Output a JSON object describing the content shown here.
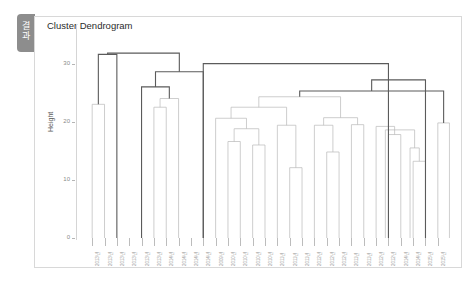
{
  "window": {
    "tab_label_line1": "결",
    "tab_label_line2": "과"
  },
  "chart_data": {
    "type": "dendrogram",
    "title": "Cluster Dendrogram",
    "xlabel": "",
    "ylabel": "Height",
    "ylim": [
      0,
      32
    ],
    "yticks": [
      0,
      10,
      20,
      30
    ],
    "ytick_labels": [
      "0",
      "10",
      "20",
      "30"
    ],
    "grid": false,
    "legend": "none",
    "leaf_count": 29,
    "leaf_labels": [
      "2013년",
      "2013년",
      "2013년",
      "2013년",
      "2013년",
      "2013년",
      "2014년",
      "2014년",
      "2014년",
      "2014년",
      "2009년",
      "2010년",
      "2010년",
      "2010년",
      "2010년",
      "2011년",
      "2011년",
      "2011년",
      "2012년",
      "2012년",
      "2012년",
      "2011년",
      "2011년",
      "2012년",
      "2012년",
      "2014년",
      "2014년",
      "2015년",
      "2015년"
    ],
    "merges": [
      {
        "id": "m1",
        "left_x": 0,
        "right_x": 1,
        "height": 23.0
      },
      {
        "id": "m2",
        "left_x": 0.5,
        "right_x": 2,
        "height": 31.6
      },
      {
        "id": "m3",
        "left_x": 5,
        "right_x": 6,
        "height": 22.5
      },
      {
        "id": "m4",
        "left_x": 5.5,
        "right_x": 7,
        "height": 24.0
      },
      {
        "id": "m5",
        "left_x": 4,
        "right_x": 6.25,
        "height": 26.0
      },
      {
        "id": "m6",
        "left_x": 5.13,
        "right_x": 9,
        "height": 28.6
      },
      {
        "id": "m7",
        "left_x": 1.25,
        "right_x": 7.06,
        "height": 31.8
      },
      {
        "id": "m8",
        "left_x": 11,
        "right_x": 12,
        "height": 16.6
      },
      {
        "id": "m9",
        "left_x": 13,
        "right_x": 14,
        "height": 16.0
      },
      {
        "id": "m10",
        "left_x": 11.5,
        "right_x": 13.5,
        "height": 18.8
      },
      {
        "id": "m11",
        "left_x": 10,
        "right_x": 12.5,
        "height": 20.6
      },
      {
        "id": "m12",
        "left_x": 16,
        "right_x": 17,
        "height": 12.1
      },
      {
        "id": "m13",
        "left_x": 15,
        "right_x": 16.5,
        "height": 19.4
      },
      {
        "id": "m14",
        "left_x": 11.25,
        "right_x": 15.75,
        "height": 22.5
      },
      {
        "id": "m15",
        "left_x": 19,
        "right_x": 20,
        "height": 14.8
      },
      {
        "id": "m16",
        "left_x": 18,
        "right_x": 19.5,
        "height": 19.4
      },
      {
        "id": "m17",
        "left_x": 21,
        "right_x": 22,
        "height": 19.5
      },
      {
        "id": "m18",
        "left_x": 18.75,
        "right_x": 21.5,
        "height": 20.7
      },
      {
        "id": "m19",
        "left_x": 13.5,
        "right_x": 20.12,
        "height": 24.3
      },
      {
        "id": "m20",
        "left_x": 24,
        "right_x": 25,
        "height": 17.8
      },
      {
        "id": "m21",
        "left_x": 23,
        "right_x": 24.5,
        "height": 19.2
      },
      {
        "id": "m22",
        "left_x": 26,
        "right_x": 27,
        "height": 13.2
      },
      {
        "id": "m23",
        "left_x": 25.75,
        "right_x": 26.5,
        "height": 15.5
      },
      {
        "id": "m24",
        "left_x": 23.75,
        "right_x": 26.12,
        "height": 18.6
      },
      {
        "id": "m25",
        "left_x": 28,
        "right_x": 28.94,
        "height": 19.8
      },
      {
        "id": "m26",
        "left_x": 16.81,
        "right_x": 28.47,
        "height": 25.3
      },
      {
        "id": "m27",
        "left_x": 22.64,
        "right_x": 27.0,
        "height": 27.2
      },
      {
        "id": "m28",
        "left_x": 9.0,
        "right_x": 24.0,
        "height": 30.0
      }
    ]
  }
}
